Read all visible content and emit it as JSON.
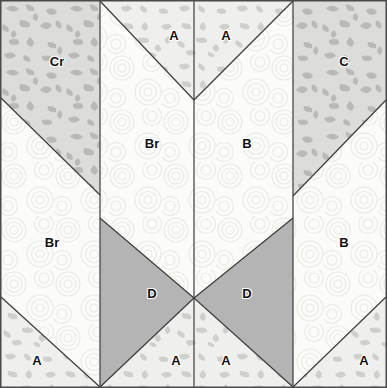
{
  "diagram": {
    "width": 387,
    "height": 388,
    "border_color": "#4a4a4a",
    "seam_line_color": "#3c3c3c",
    "background_color": "#ffffff"
  },
  "fabrics": {
    "speckled_gray": {
      "name": "speckled-gray-print",
      "base_color": "#dcdcda",
      "motif_color": "#b8b8b5"
    },
    "pale_swirl": {
      "name": "pale-cream-swirl-print",
      "base_color": "#fbfbf9",
      "motif_color": "#e8e8e2"
    },
    "light_speckle": {
      "name": "light-speckled-print",
      "base_color": "#eeeeec",
      "motif_color": "#cfcfcb"
    },
    "solid_gray": {
      "name": "medium-gray-solid",
      "base_color": "#b4b4b4",
      "motif_color": "#b4b4b4"
    }
  },
  "pieces": [
    {
      "id": "piece-cr-top-left",
      "label": "Cr",
      "fabric": "speckled_gray",
      "label_x": 57,
      "label_y": 63,
      "points": "1,1 100,1 100,195 1,98"
    },
    {
      "id": "piece-br-left",
      "label": "Br",
      "fabric": "pale_swirl",
      "label_x": 52,
      "label_y": 244,
      "points": "1,98 100,195 100,387 1,297"
    },
    {
      "id": "piece-a-bottom-left",
      "label": "A",
      "fabric": "light_speckle",
      "label_x": 37,
      "label_y": 362,
      "points": "1,297 100,387 1,387"
    },
    {
      "id": "piece-a-top-center-left",
      "label": "A",
      "fabric": "light_speckle",
      "label_x": 174,
      "label_y": 37,
      "points": "100,1 194,1 194,100 100,1"
    },
    {
      "id": "piece-br-center-left",
      "label": "Br",
      "fabric": "pale_swirl",
      "label_x": 152,
      "label_y": 145,
      "points": "100,1 194,100 194,298 100,218"
    },
    {
      "id": "piece-d-left",
      "label": "D",
      "fabric": "solid_gray",
      "label_x": 152,
      "label_y": 295,
      "points": "100,218 194,298 100,387"
    },
    {
      "id": "piece-a-bottom-center-left",
      "label": "A",
      "fabric": "light_speckle",
      "label_x": 176,
      "label_y": 362,
      "points": "100,387 194,298 194,387"
    },
    {
      "id": "piece-a-top-center-right",
      "label": "A",
      "fabric": "light_speckle",
      "label_x": 226,
      "label_y": 37,
      "points": "194,1 293,1 194,100"
    },
    {
      "id": "piece-b-center-right",
      "label": "B",
      "fabric": "pale_swirl",
      "label_x": 247,
      "label_y": 145,
      "points": "194,100 293,1 293,218 194,298"
    },
    {
      "id": "piece-d-right",
      "label": "D",
      "fabric": "solid_gray",
      "label_x": 247,
      "label_y": 295,
      "points": "194,298 293,218 293,387"
    },
    {
      "id": "piece-a-bottom-center-right",
      "label": "A",
      "fabric": "light_speckle",
      "label_x": 226,
      "label_y": 362,
      "points": "194,298 293,387 194,387"
    },
    {
      "id": "piece-c-top-right",
      "label": "C",
      "fabric": "speckled_gray",
      "label_x": 344,
      "label_y": 63,
      "points": "293,1 386,1 386,100 293,196"
    },
    {
      "id": "piece-b-right",
      "label": "B",
      "fabric": "pale_swirl",
      "label_x": 344,
      "label_y": 244,
      "points": "293,196 386,100 386,297 293,387"
    },
    {
      "id": "piece-a-bottom-right",
      "label": "A",
      "fabric": "light_speckle",
      "label_x": 364,
      "label_y": 362,
      "points": "386,297 386,387 293,387"
    }
  ],
  "seam_lines": [
    {
      "id": "seam-vertical-left",
      "x1": 100,
      "y1": 1,
      "x2": 100,
      "y2": 387
    },
    {
      "id": "seam-vertical-center",
      "x1": 194,
      "y1": 1,
      "x2": 194,
      "y2": 387
    },
    {
      "id": "seam-vertical-right",
      "x1": 293,
      "y1": 1,
      "x2": 293,
      "y2": 387
    },
    {
      "id": "seam-diag-left-upper",
      "x1": 1,
      "y1": 98,
      "x2": 100,
      "y2": 195
    },
    {
      "id": "seam-diag-left-lower",
      "x1": 1,
      "y1": 297,
      "x2": 100,
      "y2": 387
    },
    {
      "id": "seam-diag-center-v-left",
      "x1": 100,
      "y1": 1,
      "x2": 194,
      "y2": 100
    },
    {
      "id": "seam-diag-center-v-right",
      "x1": 194,
      "y1": 100,
      "x2": 293,
      "y2": 1
    },
    {
      "id": "seam-diag-d-left-upper",
      "x1": 100,
      "y1": 218,
      "x2": 194,
      "y2": 298
    },
    {
      "id": "seam-diag-d-left-lower",
      "x1": 194,
      "y1": 298,
      "x2": 100,
      "y2": 387
    },
    {
      "id": "seam-diag-d-right-upper",
      "x1": 194,
      "y1": 298,
      "x2": 293,
      "y2": 218
    },
    {
      "id": "seam-diag-d-right-lower",
      "x1": 194,
      "y1": 298,
      "x2": 293,
      "y2": 387
    },
    {
      "id": "seam-diag-right-upper",
      "x1": 293,
      "y1": 196,
      "x2": 386,
      "y2": 100
    },
    {
      "id": "seam-diag-right-lower",
      "x1": 293,
      "y1": 387,
      "x2": 386,
      "y2": 297
    }
  ],
  "legend_codes": [
    "A",
    "B",
    "C",
    "Cr",
    "D"
  ]
}
